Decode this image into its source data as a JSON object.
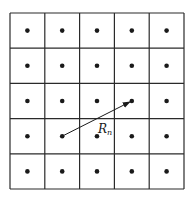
{
  "diagram": {
    "type": "lattice-grid",
    "rows": 5,
    "cols": 5,
    "grid": {
      "x": 10,
      "y": 13,
      "width": 174,
      "height": 176
    },
    "colors": {
      "line": "#2a2a2a",
      "dot": "#1a1a1a",
      "background": "#ffffff"
    },
    "vector": {
      "label_main": "R",
      "label_sub": "n",
      "from": {
        "row": 3,
        "col": 1
      },
      "to": {
        "row": 2,
        "col": 3
      }
    }
  }
}
